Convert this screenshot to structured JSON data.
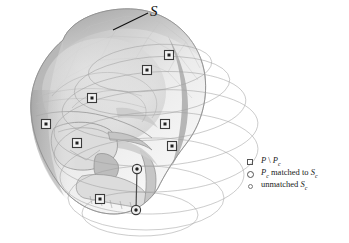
{
  "figure": {
    "type": "3d-surface-point-matching-diagram",
    "background_color": "#ffffff",
    "surface_label": "S",
    "surface_label_icon": "script-s-label",
    "leader_line_icon": "leader-line"
  },
  "legend": {
    "position": "bottom-right",
    "items": [
      {
        "marker": "square-outline",
        "marker_icon": "square-outline-icon",
        "label_plain": "P \\ Pc",
        "symbol": "P",
        "operator": "\\",
        "symbol2": "P",
        "symbol2_sub": "c"
      },
      {
        "marker": "circle-outline-large",
        "marker_icon": "circle-outline-large-icon",
        "label_plain": "Pc matched to Sc",
        "symbol": "P",
        "symbol_sub": "c",
        "text": " matched to ",
        "symbol2": "S",
        "symbol2_sub": "c"
      },
      {
        "marker": "circle-outline-small",
        "marker_icon": "circle-outline-small-icon",
        "label_plain": "unmatched Sc",
        "text": "unmatched ",
        "symbol2": "S",
        "symbol2_sub": "c"
      }
    ]
  },
  "colors": {
    "skull_light": "#e9e9e9",
    "skull_mid": "#cfcfcf",
    "skull_dark": "#a8a8a8",
    "skull_shadow": "#8f8f8f",
    "contour_line": "#9a9a9a",
    "marker_stroke": "#3a3a3a",
    "marker_fill": "#222222",
    "text": "#111111"
  },
  "markers": {
    "square_points": [
      {
        "id": "sq-1",
        "x": 169,
        "y": 55
      },
      {
        "id": "sq-2",
        "x": 147,
        "y": 70
      },
      {
        "id": "sq-3",
        "x": 92,
        "y": 98
      },
      {
        "id": "sq-4",
        "x": 46,
        "y": 124
      },
      {
        "id": "sq-5",
        "x": 77,
        "y": 143
      },
      {
        "id": "sq-6",
        "x": 165,
        "y": 124
      },
      {
        "id": "sq-7",
        "x": 172,
        "y": 146
      },
      {
        "id": "sq-8",
        "x": 100,
        "y": 199
      }
    ],
    "circle_points": [
      {
        "id": "ci-1",
        "x": 137,
        "y": 169
      },
      {
        "id": "ci-2",
        "x": 136,
        "y": 210
      }
    ],
    "connector": {
      "x1": 137,
      "y1": 169,
      "x2": 136,
      "y2": 210
    }
  },
  "contours": {
    "count": 7,
    "description": "concentric elliptical cross-section slices"
  }
}
